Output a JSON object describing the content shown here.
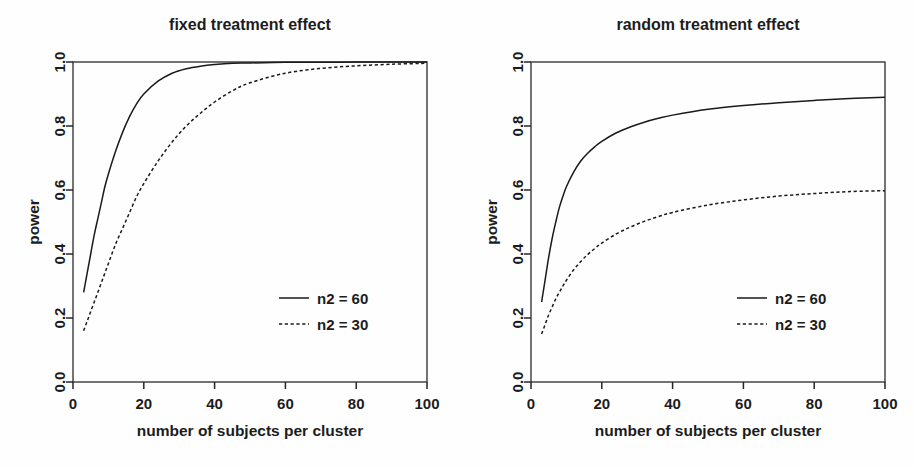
{
  "figure": {
    "background": "#fefefe",
    "line_color": "#1a1a1a",
    "panel_count": 2
  },
  "chart_data": [
    {
      "type": "line",
      "title": "fixed treatment effect",
      "xlabel": "number of subjects per cluster",
      "ylabel": "power",
      "xlim": [
        0,
        100
      ],
      "ylim": [
        0.0,
        1.0
      ],
      "xticks": [
        0,
        20,
        40,
        60,
        80,
        100
      ],
      "xticklabels": [
        "0",
        "20",
        "40",
        "60",
        "80",
        "100"
      ],
      "yticks": [
        0.0,
        0.2,
        0.4,
        0.6,
        0.8,
        1.0
      ],
      "yticklabels": [
        "0.0",
        "0.2",
        "0.4",
        "0.6",
        "0.8",
        "1.0"
      ],
      "grid": false,
      "legend_position": "lower right",
      "series": [
        {
          "name": "n2 = 60",
          "style": "solid",
          "x": [
            3,
            4,
            5,
            6,
            7,
            8,
            9,
            10,
            12,
            14,
            16,
            18,
            20,
            24,
            28,
            32,
            36,
            40,
            45,
            50,
            60,
            70,
            80,
            90,
            100
          ],
          "values": [
            0.28,
            0.34,
            0.4,
            0.46,
            0.51,
            0.56,
            0.61,
            0.65,
            0.72,
            0.78,
            0.83,
            0.87,
            0.9,
            0.94,
            0.965,
            0.979,
            0.987,
            0.992,
            0.996,
            0.997,
            0.999,
            0.999,
            1.0,
            1.0,
            1.0
          ]
        },
        {
          "name": "n2 = 30",
          "style": "dashed",
          "x": [
            3,
            4,
            5,
            6,
            7,
            8,
            9,
            10,
            12,
            14,
            16,
            18,
            20,
            24,
            28,
            32,
            36,
            40,
            45,
            50,
            60,
            70,
            80,
            90,
            100
          ],
          "values": [
            0.16,
            0.19,
            0.22,
            0.25,
            0.28,
            0.31,
            0.34,
            0.37,
            0.43,
            0.48,
            0.53,
            0.58,
            0.62,
            0.69,
            0.75,
            0.8,
            0.84,
            0.875,
            0.91,
            0.935,
            0.965,
            0.98,
            0.988,
            0.993,
            0.996
          ]
        }
      ]
    },
    {
      "type": "line",
      "title": "random treatment effect",
      "xlabel": "number of subjects per cluster",
      "ylabel": "power",
      "xlim": [
        0,
        100
      ],
      "ylim": [
        0.0,
        1.0
      ],
      "xticks": [
        0,
        20,
        40,
        60,
        80,
        100
      ],
      "xticklabels": [
        "0",
        "20",
        "40",
        "60",
        "80",
        "100"
      ],
      "yticks": [
        0.0,
        0.2,
        0.4,
        0.6,
        0.8,
        1.0
      ],
      "yticklabels": [
        "0.0",
        "0.2",
        "0.4",
        "0.6",
        "0.8",
        "1.0"
      ],
      "grid": false,
      "legend_position": "lower right",
      "series": [
        {
          "name": "n2 = 60",
          "style": "solid",
          "x": [
            3,
            4,
            5,
            6,
            7,
            8,
            9,
            10,
            12,
            14,
            16,
            18,
            20,
            24,
            28,
            32,
            36,
            40,
            50,
            60,
            70,
            80,
            90,
            100
          ],
          "values": [
            0.25,
            0.32,
            0.39,
            0.45,
            0.5,
            0.545,
            0.58,
            0.61,
            0.655,
            0.69,
            0.715,
            0.735,
            0.752,
            0.778,
            0.797,
            0.812,
            0.824,
            0.834,
            0.852,
            0.864,
            0.873,
            0.88,
            0.886,
            0.89
          ]
        },
        {
          "name": "n2 = 30",
          "style": "dashed",
          "x": [
            3,
            4,
            5,
            6,
            7,
            8,
            9,
            10,
            12,
            14,
            16,
            18,
            20,
            24,
            28,
            32,
            36,
            40,
            50,
            60,
            70,
            80,
            90,
            100
          ],
          "values": [
            0.15,
            0.18,
            0.21,
            0.235,
            0.26,
            0.28,
            0.3,
            0.318,
            0.35,
            0.376,
            0.398,
            0.417,
            0.434,
            0.462,
            0.484,
            0.502,
            0.517,
            0.53,
            0.553,
            0.569,
            0.581,
            0.589,
            0.595,
            0.598
          ]
        }
      ]
    }
  ]
}
